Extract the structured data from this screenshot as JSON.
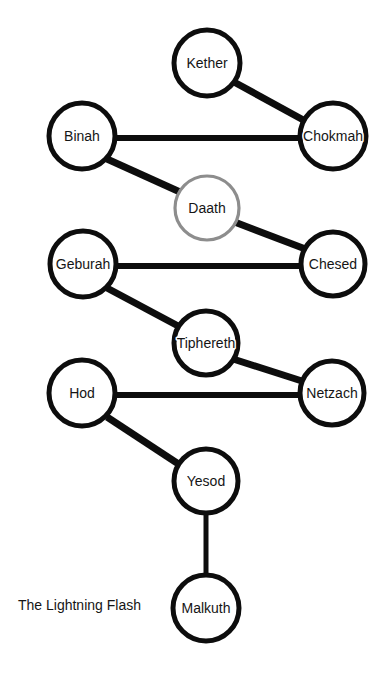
{
  "diagram": {
    "title": "The Lightning Flash",
    "caption": "The Lightning Flash",
    "caption_position": {
      "x": 18,
      "y": 606
    },
    "background_color": "#ffffff",
    "node_stroke_color": "#0d0d0d",
    "veiled_node_stroke_color": "#8d8d8d",
    "edge_color": "#0d0d0d",
    "label_color": "#151515",
    "width": 384,
    "height": 685
  },
  "nodes": [
    {
      "id": "kether",
      "label": "Kether",
      "cx": 207,
      "cy": 63,
      "r": 33,
      "style": "solid"
    },
    {
      "id": "chokmah",
      "label": "Chokmah",
      "cx": 333,
      "cy": 136,
      "r": 33,
      "style": "solid"
    },
    {
      "id": "binah",
      "label": "Binah",
      "cx": 82,
      "cy": 136,
      "r": 33,
      "style": "solid"
    },
    {
      "id": "daath",
      "label": "Daath",
      "cx": 207,
      "cy": 208,
      "r": 32,
      "style": "veiled"
    },
    {
      "id": "chesed",
      "label": "Chesed",
      "cx": 333,
      "cy": 264,
      "r": 32,
      "style": "solid"
    },
    {
      "id": "geburah",
      "label": "Geburah",
      "cx": 83,
      "cy": 264,
      "r": 33,
      "style": "solid"
    },
    {
      "id": "tiphereth",
      "label": "Tiphereth",
      "cx": 206,
      "cy": 343,
      "r": 32,
      "style": "solid"
    },
    {
      "id": "netzach",
      "label": "Netzach",
      "cx": 332,
      "cy": 393,
      "r": 32,
      "style": "solid"
    },
    {
      "id": "hod",
      "label": "Hod",
      "cx": 82,
      "cy": 393,
      "r": 33,
      "style": "solid"
    },
    {
      "id": "yesod",
      "label": "Yesod",
      "cx": 206,
      "cy": 481,
      "r": 32,
      "style": "solid"
    },
    {
      "id": "malkuth",
      "label": "Malkuth",
      "cx": 206,
      "cy": 608,
      "r": 33,
      "style": "solid"
    }
  ],
  "edges": [
    {
      "id": "kether-chokmah",
      "from": "kether",
      "to": "chokmah",
      "x1": 234,
      "y1": 82,
      "x2": 307,
      "y2": 122,
      "width": 7
    },
    {
      "id": "chokmah-binah",
      "from": "chokmah",
      "to": "binah",
      "x1": 115,
      "y1": 138,
      "x2": 301,
      "y2": 138,
      "width": 6
    },
    {
      "id": "binah-daath",
      "from": "binah",
      "to": "daath",
      "x1": 107,
      "y1": 159,
      "x2": 180,
      "y2": 192,
      "width": 7
    },
    {
      "id": "daath-chesed",
      "from": "daath",
      "to": "chesed",
      "x1": 232,
      "y1": 221,
      "x2": 308,
      "y2": 250,
      "width": 7
    },
    {
      "id": "chesed-geburah",
      "from": "chesed",
      "to": "geburah",
      "x1": 115,
      "y1": 266,
      "x2": 301,
      "y2": 266,
      "width": 6
    },
    {
      "id": "geburah-tiphereth",
      "from": "geburah",
      "to": "tiphereth",
      "x1": 107,
      "y1": 288,
      "x2": 180,
      "y2": 327,
      "width": 7
    },
    {
      "id": "tiphereth-netzach",
      "from": "tiphereth",
      "to": "netzach",
      "x1": 230,
      "y1": 358,
      "x2": 305,
      "y2": 382,
      "width": 7
    },
    {
      "id": "netzach-hod",
      "from": "netzach",
      "to": "hod",
      "x1": 114,
      "y1": 395,
      "x2": 300,
      "y2": 395,
      "width": 6
    },
    {
      "id": "hod-yesod",
      "from": "hod",
      "to": "yesod",
      "x1": 107,
      "y1": 417,
      "x2": 180,
      "y2": 465,
      "width": 7
    },
    {
      "id": "yesod-malkuth",
      "from": "yesod",
      "to": "malkuth",
      "x1": 206,
      "y1": 511,
      "x2": 206,
      "y2": 577,
      "width": 5
    }
  ]
}
